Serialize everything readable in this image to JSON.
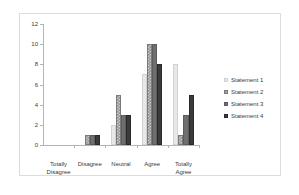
{
  "chart_data": {
    "type": "bar",
    "title": "",
    "subtitle": "",
    "xlabel": "",
    "ylabel": "",
    "ylim": [
      0,
      12
    ],
    "yticks": [
      0,
      2,
      4,
      6,
      8,
      10,
      12
    ],
    "ytick_labels": [
      "0",
      "2",
      "4",
      "6",
      "8",
      "10",
      "12"
    ],
    "grid": false,
    "legend_position": "right",
    "categories": [
      "Totally\nDisagree",
      "Disagree",
      "Neutral",
      "Agree",
      "Totally\nAgree"
    ],
    "series": [
      {
        "name": "Statement 1",
        "color": "#e8e8e8",
        "values": [
          0,
          0,
          2,
          7,
          8
        ]
      },
      {
        "name": "Statement 2",
        "color": "#989898",
        "values": [
          0,
          1,
          5,
          10,
          1
        ]
      },
      {
        "name": "Statement 3",
        "color": "#6f6f6f",
        "values": [
          0,
          1,
          3,
          10,
          3
        ]
      },
      {
        "name": "Statement 4",
        "color": "#3a3a3a",
        "values": [
          0,
          1,
          3,
          8,
          5
        ]
      }
    ]
  },
  "legend": {
    "items": [
      {
        "label": "Statement 1"
      },
      {
        "label": "Statement 2"
      },
      {
        "label": "Statement 3"
      },
      {
        "label": "Statement 4"
      }
    ]
  }
}
